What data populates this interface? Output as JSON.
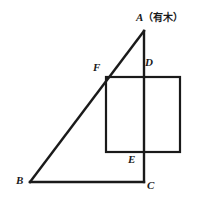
{
  "figure": {
    "title_fragment": "geometry figure",
    "background_color": "#ffffff",
    "stroke_color": "#1a1a1a",
    "top_cut_text": "——————",
    "labels": {
      "A": "A",
      "A_annotation": "（有木）",
      "B": "B",
      "C": "C",
      "D": "D",
      "E": "E",
      "F": "F"
    },
    "points": {
      "A": {
        "x": 144,
        "y": 31
      },
      "B": {
        "x": 30,
        "y": 182
      },
      "C": {
        "x": 144,
        "y": 182
      },
      "D": {
        "x": 144,
        "y": 77
      },
      "E": {
        "x": 144,
        "y": 152
      },
      "F": {
        "x": 106,
        "y": 77
      }
    },
    "square": {
      "left": 106,
      "top": 77,
      "right": 180,
      "bottom": 152
    },
    "shapes": [
      {
        "name": "triangle-hypotenuse-AB",
        "from": "A",
        "to": "B"
      },
      {
        "name": "triangle-base-BC",
        "from": "B",
        "to": "C"
      },
      {
        "name": "triangle-leg-AC",
        "from": "A",
        "to": "C"
      },
      {
        "name": "square-FDEF",
        "type": "rect"
      }
    ],
    "line_width": 2
  }
}
